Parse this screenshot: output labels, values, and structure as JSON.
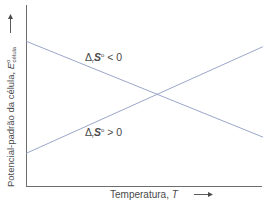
{
  "chart_data": {
    "type": "line",
    "title": "",
    "xlabel": "Temperatura, T",
    "ylabel": "Potencial-padrão da célula, E°célula",
    "ylabel_main": "Potencial-padrão da célula, ",
    "ylabel_symbol": "E",
    "ylabel_sup": "o",
    "ylabel_sub": "célula",
    "xlabel_main": "Temperatura, ",
    "xlabel_symbol": "T",
    "x": [
      0,
      1
    ],
    "xlim": [
      0,
      1
    ],
    "ylim": [
      0,
      1
    ],
    "grid": false,
    "legend": "none (inline line labels)",
    "ticks": "none",
    "series": [
      {
        "name": "ΔrS° < 0",
        "label_prefix": "Δ",
        "label_sub": "r",
        "label_symbol": "S",
        "label_sup": "o",
        "label_rel": " < 0",
        "values": [
          0.8,
          0.27
        ],
        "trend": "decreasing"
      },
      {
        "name": "ΔrS° > 0",
        "label_prefix": "Δ",
        "label_sub": "r",
        "label_symbol": "S",
        "label_sup": "o",
        "label_rel": " > 0",
        "values": [
          0.18,
          0.77
        ],
        "trend": "increasing"
      }
    ],
    "annotations": [
      "lines intersect near the middle of the temperature range"
    ],
    "colors": {
      "axis": "#6e6e6e",
      "series": "#8e9cc4",
      "text": "#4a4a4a"
    }
  }
}
